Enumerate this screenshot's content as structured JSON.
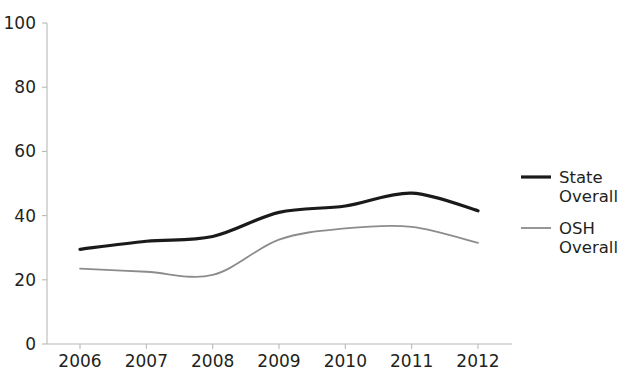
{
  "chart_data": {
    "type": "line",
    "title": "",
    "subtitle": "",
    "xlabel": "",
    "ylabel": "",
    "categories": [
      "2006",
      "2007",
      "2008",
      "2009",
      "2010",
      "2011",
      "2012"
    ],
    "x": [
      2006,
      2007,
      2008,
      2009,
      2010,
      2011,
      2012
    ],
    "series": [
      {
        "name": "State Overall",
        "legend_line_1": "State",
        "legend_line_2": "Overall",
        "color": "#1a1a1a",
        "line_width": 3.2,
        "values": [
          29.5,
          32,
          33.5,
          41,
          43,
          47,
          41.5
        ]
      },
      {
        "name": "OSH Overall",
        "legend_line_1": "OSH",
        "legend_line_2": "Overall",
        "color": "#8c8c8c",
        "line_width": 1.8,
        "values": [
          23.5,
          22.5,
          21.5,
          32.5,
          36,
          36.5,
          31.5
        ]
      }
    ],
    "ylim": [
      0,
      100
    ],
    "yticks": [
      0,
      20,
      40,
      60,
      80,
      100
    ],
    "ytick_labels": [
      "0",
      "20",
      "40",
      "60",
      "80",
      "100"
    ],
    "xtick_labels": [
      "2006",
      "2007",
      "2008",
      "2009",
      "2010",
      "2011",
      "2012"
    ],
    "grid": false,
    "legend_position": "right",
    "smoothing": "spline",
    "axis_color": "#b9b9b9",
    "background": "#ffffff"
  }
}
